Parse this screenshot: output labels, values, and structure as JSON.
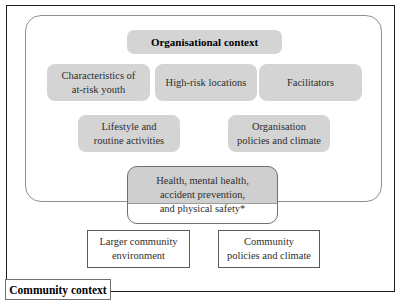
{
  "colors": {
    "box_fill": "#d4d4d4",
    "health_box_fill": "#cfcfcf",
    "outer_frame_border": "#1c1c1c",
    "inner_frame_border": "#8f8f8f",
    "health_box_border": "#6f6f6f",
    "white_box_border": "#5a5a5a"
  },
  "org_section": {
    "title": "Organisational context",
    "row1": [
      {
        "label": "Characteristics of\nat-risk youth"
      },
      {
        "label": "High-risk locations"
      },
      {
        "label": "Facilitators"
      }
    ],
    "row2": [
      {
        "label": "Lifestyle and\nroutine activities"
      },
      {
        "label": "Organisation\npolicies and climate"
      }
    ]
  },
  "health_box": {
    "label": "Health, mental health,\naccident prevention,\nand physical safety*"
  },
  "community_section": {
    "boxes": [
      {
        "label": "Larger community\nenvironment"
      },
      {
        "label": "Community\npolicies and climate"
      }
    ],
    "label": "Community context"
  }
}
